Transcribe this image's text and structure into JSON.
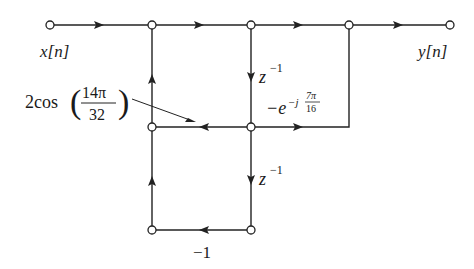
{
  "diagram": {
    "type": "signal-flow-graph",
    "colors": {
      "line": "#222222",
      "node_fill": "#ffffff",
      "background": "#ffffff"
    },
    "labels": {
      "input": "x[n]",
      "output": "y[n]",
      "coef_cos_prefix": "2cos",
      "coef_cos_num": "14π",
      "coef_cos_den": "32",
      "delay_top": "z",
      "delay_top_exp": "−1",
      "delay_bottom": "z",
      "delay_bottom_exp": "−1",
      "coef_exp_base": "−e",
      "coef_exp_sup": "−j",
      "coef_exp_num": "7π",
      "coef_exp_den": "16",
      "coef_neg_one": "−1"
    },
    "nodes": [
      {
        "id": "in",
        "x": 50,
        "y": 25
      },
      {
        "id": "n1",
        "x": 152,
        "y": 25
      },
      {
        "id": "n2",
        "x": 251,
        "y": 25
      },
      {
        "id": "n3",
        "x": 349,
        "y": 25
      },
      {
        "id": "out",
        "x": 450,
        "y": 25
      },
      {
        "id": "m1",
        "x": 152,
        "y": 127
      },
      {
        "id": "m2",
        "x": 251,
        "y": 127
      },
      {
        "id": "b1",
        "x": 152,
        "y": 230
      },
      {
        "id": "b2",
        "x": 251,
        "y": 230
      }
    ],
    "edges": [
      {
        "from": "in",
        "to": "n1",
        "gain": ""
      },
      {
        "from": "n1",
        "to": "n2",
        "gain": ""
      },
      {
        "from": "n2",
        "to": "n3",
        "gain": ""
      },
      {
        "from": "n3",
        "to": "out",
        "gain": ""
      },
      {
        "from": "m1",
        "to": "n1",
        "gain": ""
      },
      {
        "from": "n2",
        "to": "m2",
        "gain": "z^-1"
      },
      {
        "from": "m2",
        "to": "m1",
        "gain": "2cos(14π/32)"
      },
      {
        "from": "m2",
        "to": "n3",
        "gain": "-e^{-j7π/16}"
      },
      {
        "from": "m2",
        "to": "b2",
        "gain": "z^-1"
      },
      {
        "from": "b2",
        "to": "b1",
        "gain": "-1"
      },
      {
        "from": "b1",
        "to": "m1",
        "gain": ""
      }
    ]
  }
}
